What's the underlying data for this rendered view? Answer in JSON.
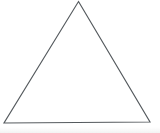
{
  "figure": {
    "kind": "line-drawing",
    "background_color": "#ffffff",
    "stroke_color": "#555a5e",
    "stroke_width": 1.15,
    "canvas": {
      "width": 160,
      "height": 133
    },
    "vertices": [
      {
        "name": "apex",
        "x": 78.5,
        "y": 1.5
      },
      {
        "name": "bottom-right",
        "x": 150.0,
        "y": 122.0
      },
      {
        "name": "bottom-left",
        "x": 4.0,
        "y": 123.0
      }
    ],
    "points_attr": "78.5,1.5 150,122 4,123",
    "closed": true,
    "labels": [],
    "annotations": []
  }
}
